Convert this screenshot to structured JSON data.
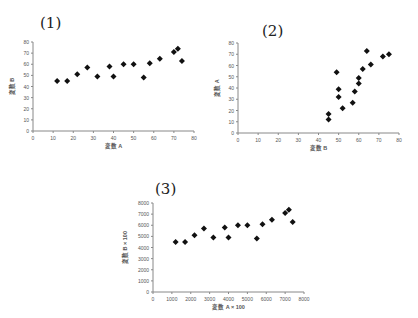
{
  "chart_data": [
    {
      "type": "scatter",
      "title": "(1)",
      "xlabel": "変数 A",
      "ylabel": "変数 B",
      "xlim": [
        0,
        80
      ],
      "ylim": [
        0,
        80
      ],
      "xticks": [
        0,
        10,
        20,
        30,
        40,
        50,
        60,
        70,
        80
      ],
      "yticks": [
        0,
        10,
        20,
        30,
        40,
        50,
        60,
        70,
        80
      ],
      "grid": false,
      "marker": "diamond",
      "x": [
        12,
        17,
        22,
        27,
        32,
        38,
        40,
        45,
        50,
        55,
        58,
        63,
        70,
        72,
        74
      ],
      "y": [
        45,
        45,
        51,
        57,
        49,
        58,
        49,
        60,
        60,
        48,
        61,
        65,
        71,
        74,
        63
      ]
    },
    {
      "type": "scatter",
      "title": "(2)",
      "xlabel": "変数 B",
      "ylabel": "変数 A",
      "xlim": [
        0,
        80
      ],
      "ylim": [
        0,
        80
      ],
      "xticks": [
        0,
        10,
        20,
        30,
        40,
        50,
        60,
        70,
        80
      ],
      "yticks": [
        0,
        10,
        20,
        30,
        40,
        50,
        60,
        70,
        80
      ],
      "grid": false,
      "marker": "diamond",
      "x": [
        45,
        45,
        49,
        50,
        50,
        52,
        57,
        58,
        60,
        60,
        62,
        64,
        66,
        72,
        75
      ],
      "y": [
        17,
        12,
        54,
        39,
        32,
        22,
        27,
        37,
        44,
        49,
        57,
        73,
        61,
        68,
        70
      ]
    },
    {
      "type": "scatter",
      "title": "(3)",
      "xlabel": "変数 A × 100",
      "ylabel": "変数 B × 100",
      "xlim": [
        0,
        8000
      ],
      "ylim": [
        0,
        8000
      ],
      "xticks": [
        0,
        1000,
        2000,
        3000,
        4000,
        5000,
        6000,
        7000,
        8000
      ],
      "yticks": [
        0,
        1000,
        2000,
        3000,
        4000,
        5000,
        6000,
        7000,
        8000
      ],
      "grid": false,
      "marker": "diamond",
      "x": [
        1200,
        1700,
        2200,
        2700,
        3200,
        3800,
        4000,
        4500,
        5000,
        5500,
        5800,
        6300,
        7000,
        7200,
        7400
      ],
      "y": [
        4500,
        4500,
        5100,
        5700,
        4900,
        5800,
        4900,
        6000,
        6000,
        4800,
        6100,
        6500,
        7100,
        7400,
        6300
      ]
    }
  ],
  "panels": [
    {
      "title": "(1)",
      "xlabel": "変数 A",
      "ylabel": "変数 B"
    },
    {
      "title": "(2)",
      "xlabel": "変数 B",
      "ylabel": "変数 A"
    },
    {
      "title": "(3)",
      "xlabel": "変数 A × 100",
      "ylabel": "変数 B × 100"
    }
  ],
  "colors": {
    "marker": "#111111",
    "axis": "#888888",
    "tick_text": "#555555"
  }
}
